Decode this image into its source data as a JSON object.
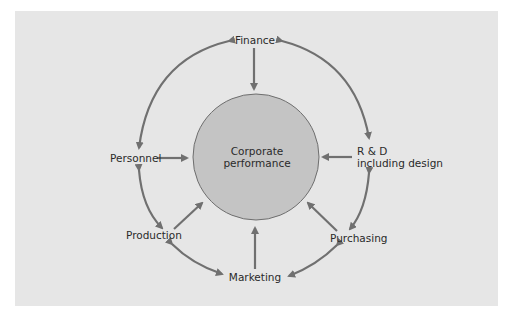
{
  "diagram": {
    "center": {
      "line1": "Corporate",
      "line2": "performance"
    },
    "nodes": {
      "finance": "Finance",
      "personnel": "Personnel",
      "rd_line1": "R & D",
      "rd_line2": "including design",
      "production": "Production",
      "purchasing": "Purchasing",
      "marketing": "Marketing"
    },
    "colors": {
      "background": "#e6e6e6",
      "circle_fill": "#c4c4c4",
      "circle_stroke": "#6e6e6e",
      "arrow": "#707070",
      "text": "#2a2a2a"
    }
  }
}
